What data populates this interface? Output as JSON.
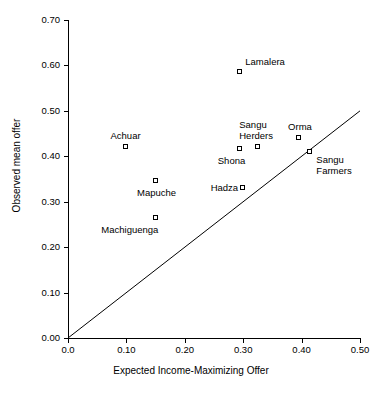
{
  "chart_data": {
    "type": "scatter",
    "title": "",
    "xlabel": "Expected Income-Maximizing Offer",
    "ylabel": "Observed mean offer",
    "xlim": [
      0.0,
      0.5
    ],
    "ylim": [
      0.0,
      0.7
    ],
    "xticks": [
      "0.0",
      "0.10",
      "0.20",
      "0.30",
      "0.40",
      "0.50"
    ],
    "xtick_values": [
      0.0,
      0.1,
      0.2,
      0.3,
      0.4,
      0.5
    ],
    "yticks": [
      "0.00",
      "0.10",
      "0.20",
      "0.30",
      "0.40",
      "0.50",
      "0.60",
      "0.70"
    ],
    "ytick_values": [
      0.0,
      0.1,
      0.2,
      0.3,
      0.4,
      0.5,
      0.6,
      0.7
    ],
    "grid": false,
    "legend": "none",
    "marker": "open-square",
    "reference_line": {
      "name": "identity-line",
      "description": "45 degree line y = x",
      "from": [
        0.0,
        0.0
      ],
      "to": [
        0.5,
        0.5
      ]
    },
    "points": [
      {
        "label": "Achuar",
        "x": 0.1,
        "y": 0.42,
        "label_pos": "above"
      },
      {
        "label": "Mapuche",
        "x": 0.15,
        "y": 0.345,
        "label_pos": "below"
      },
      {
        "label": "Machiguenga",
        "x": 0.15,
        "y": 0.265,
        "label_pos": "below-left"
      },
      {
        "label": "Lamalera",
        "x": 0.295,
        "y": 0.585,
        "label_pos": "above-right"
      },
      {
        "label": "Shona",
        "x": 0.295,
        "y": 0.415,
        "label_pos": "below-left"
      },
      {
        "label": "Hadza",
        "x": 0.3,
        "y": 0.33,
        "label_pos": "left"
      },
      {
        "label": "Sangu\nHerders",
        "x": 0.325,
        "y": 0.42,
        "label_pos": "above"
      },
      {
        "label": "Orma",
        "x": 0.395,
        "y": 0.44,
        "label_pos": "above"
      },
      {
        "label": "Sangu\nFarmers",
        "x": 0.415,
        "y": 0.41,
        "label_pos": "right-below"
      }
    ]
  },
  "axis_color": "#000000",
  "background_color": "#ffffff"
}
